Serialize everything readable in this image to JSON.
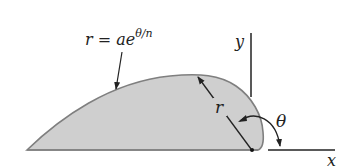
{
  "diagram": {
    "type": "polar-spiral-shape",
    "formula": {
      "lhs": "r = ae",
      "exponent": "θ/n",
      "full": "r = ae^(θ/n)"
    },
    "labels": {
      "radius": "r",
      "angle": "θ",
      "x_axis": "x",
      "y_axis": "y"
    },
    "colors": {
      "fill": "#cfcfcf",
      "outline": "#7a7a7a",
      "line": "#222222"
    }
  }
}
